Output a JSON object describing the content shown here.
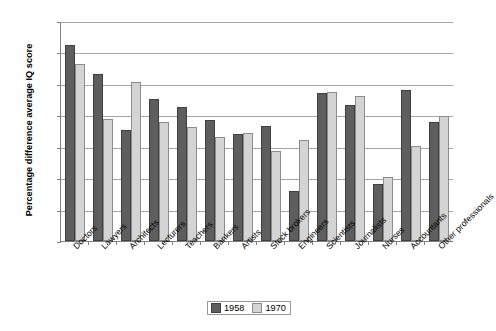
{
  "chart_data": {
    "type": "bar",
    "title": "",
    "xlabel": "",
    "ylabel": "Percentage difference average IQ score",
    "ylim": [
      0,
      14
    ],
    "ytick_step": 2,
    "ytick_labels": [
      "0.00",
      "2.00",
      "4.00",
      "6.00",
      "8.00",
      "10.00",
      "12.00",
      "14.00"
    ],
    "grid": true,
    "legend_position": "bottom-center",
    "categories": [
      "Doctors",
      "Lawyers",
      "Architects",
      "Lecturers",
      "Teachers",
      "Bankers",
      "Artists",
      "Stock brokers",
      "Engineers",
      "Scientists",
      "Journalists",
      "Nurses",
      "Accountants",
      "Other professionals"
    ],
    "series": [
      {
        "name": "1958",
        "color": "#5e5e5e",
        "values": [
          12.5,
          10.65,
          7.05,
          9.05,
          8.55,
          7.7,
          6.8,
          7.35,
          3.2,
          9.4,
          8.65,
          3.6,
          9.6,
          7.6
        ]
      },
      {
        "name": "1970",
        "color": "#d4d4d4",
        "values": [
          11.25,
          7.75,
          10.15,
          7.6,
          7.25,
          6.6,
          6.9,
          5.7,
          6.45,
          9.5,
          9.25,
          4.1,
          6.05,
          7.95
        ]
      }
    ]
  },
  "legend": {
    "items": [
      {
        "label": "1958",
        "swatch": "series-1958-swatch"
      },
      {
        "label": "1970",
        "swatch": "series-1970-swatch"
      }
    ]
  }
}
